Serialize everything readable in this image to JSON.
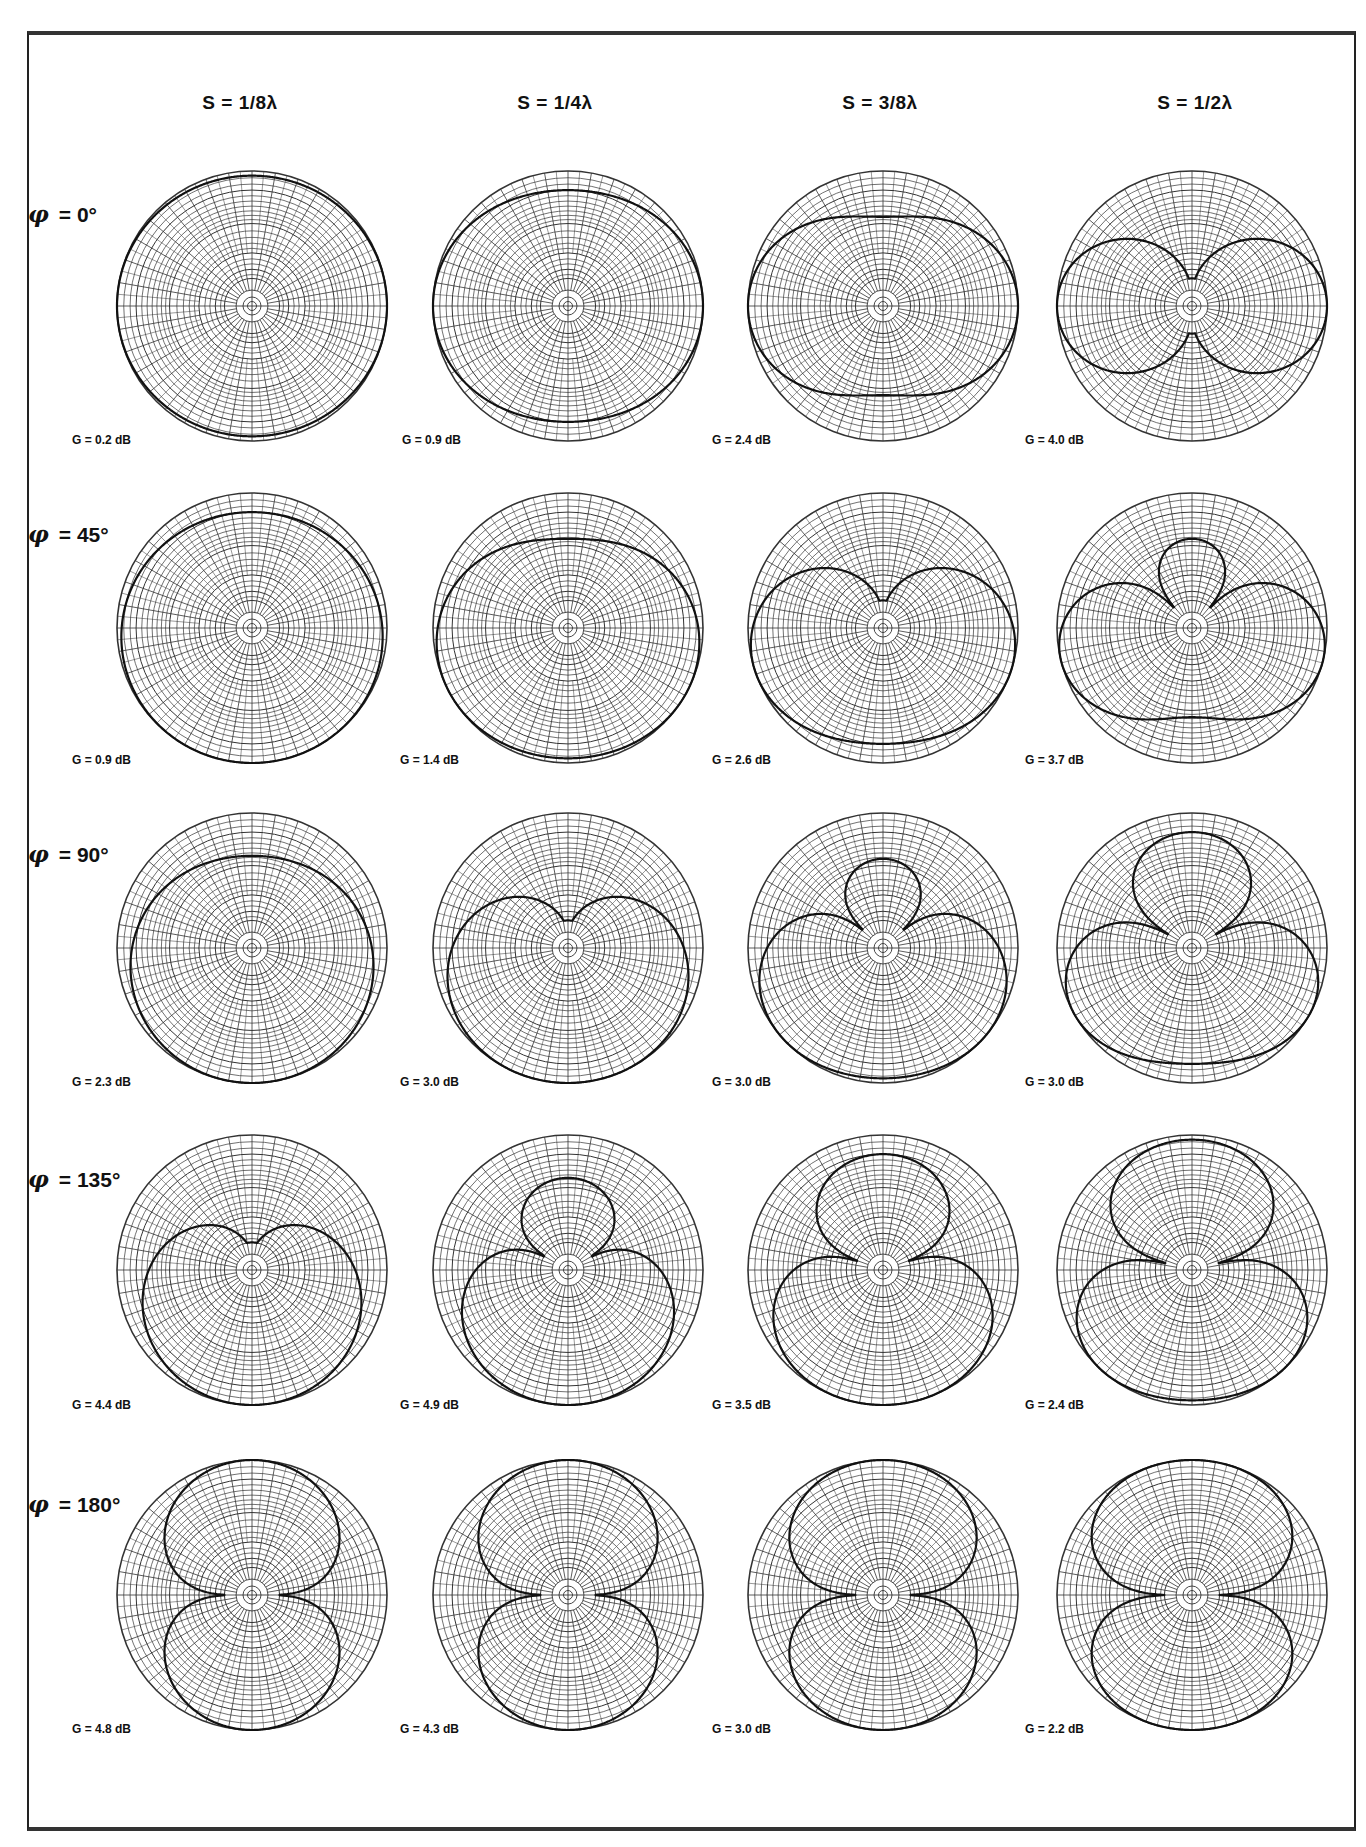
{
  "figure": {
    "column_headers": [
      "S = 1/8λ",
      "S = 1/4λ",
      "S = 3/8λ",
      "S = 1/2λ"
    ],
    "row_labels": [
      {
        "symbol": "φ",
        "text": "= 0°"
      },
      {
        "symbol": "φ",
        "text": "= 45°"
      },
      {
        "symbol": "φ",
        "text": "= 90°"
      },
      {
        "symbol": "φ",
        "text": "= 135°"
      },
      {
        "symbol": "φ",
        "text": "= 180°"
      }
    ],
    "gains": [
      [
        "G = 0.2 dB",
        "G = 0.9 dB",
        "G = 2.4 dB",
        "G = 4.0 dB"
      ],
      [
        "G = 0.9 dB",
        "G = 1.4 dB",
        "G = 2.6 dB",
        "G = 3.7 dB"
      ],
      [
        "G = 2.3 dB",
        "G = 3.0 dB",
        "G = 3.0 dB",
        "G = 3.0 dB"
      ],
      [
        "G = 4.4 dB",
        "G = 4.9 dB",
        "G = 3.5 dB",
        "G = 2.4 dB"
      ],
      [
        "G = 4.8 dB",
        "G = 4.3 dB",
        "G = 3.0 dB",
        "G = 2.2 dB"
      ]
    ]
  },
  "chart_data": {
    "type": "polar",
    "layout": {
      "rows": 5,
      "cols": 4,
      "grid": "polar, log-periodic rings with radial spokes"
    },
    "x_parameter": {
      "name": "Element spacing S",
      "unit": "wavelength",
      "values": [
        0.125,
        0.25,
        0.375,
        0.5
      ],
      "labels": [
        "S = 1/8λ",
        "S = 1/4λ",
        "S = 3/8λ",
        "S = 1/2λ"
      ]
    },
    "y_parameter": {
      "name": "Phase difference φ",
      "unit": "degrees",
      "values": [
        0,
        45,
        90,
        135,
        180
      ],
      "labels": [
        "φ = 0°",
        "φ = 45°",
        "φ = 90°",
        "φ = 135°",
        "φ = 180°"
      ]
    },
    "series": [
      {
        "phase_deg": 0,
        "spacing_wl": [
          0.125,
          0.25,
          0.375,
          0.5
        ],
        "gain_db": [
          0.2,
          0.9,
          2.4,
          4.0
        ]
      },
      {
        "phase_deg": 45,
        "spacing_wl": [
          0.125,
          0.25,
          0.375,
          0.5
        ],
        "gain_db": [
          0.9,
          1.4,
          2.6,
          3.7
        ]
      },
      {
        "phase_deg": 90,
        "spacing_wl": [
          0.125,
          0.25,
          0.375,
          0.5
        ],
        "gain_db": [
          2.3,
          3.0,
          3.0,
          3.0
        ]
      },
      {
        "phase_deg": 135,
        "spacing_wl": [
          0.125,
          0.25,
          0.375,
          0.5
        ],
        "gain_db": [
          4.4,
          4.9,
          3.5,
          2.4
        ]
      },
      {
        "phase_deg": 180,
        "spacing_wl": [
          0.125,
          0.25,
          0.375,
          0.5
        ],
        "gain_db": [
          4.8,
          4.3,
          3.0,
          2.2
        ]
      }
    ],
    "pattern_model": "|cos((2π·S·cosθ + φ)/2)|, array axis vertical",
    "legend": "none",
    "colors": {
      "ink": "#111111",
      "grid": "#333333",
      "paper": "#ffffff"
    }
  }
}
